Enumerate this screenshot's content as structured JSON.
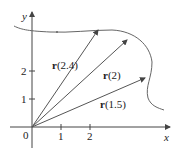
{
  "axes": {
    "x_label": "x",
    "y_label": "y",
    "origin_label": "0",
    "x_ticks": [
      "1",
      "2"
    ],
    "y_ticks": [
      "1",
      "2"
    ]
  },
  "vectors": [
    {
      "name": "r",
      "param": "(2.4)"
    },
    {
      "name": "r",
      "param": "(2)"
    },
    {
      "name": "r",
      "param": "(1.5)"
    }
  ],
  "colors": {
    "line": "#555555",
    "text": "#222222"
  }
}
